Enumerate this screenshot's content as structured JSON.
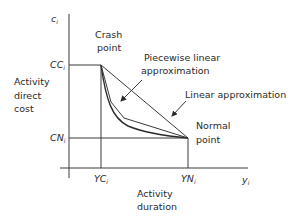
{
  "diagram": {
    "y_axis": {
      "symbol": "c",
      "subscript": "i",
      "label_lines": [
        "Activity",
        "direct",
        "cost"
      ]
    },
    "x_axis": {
      "symbol": "y",
      "subscript": "i",
      "label_lines": [
        "Activity",
        "duration"
      ]
    },
    "y_ticks": [
      {
        "base": "CC",
        "sub": "i"
      },
      {
        "base": "CN",
        "sub": "i"
      }
    ],
    "x_ticks": [
      {
        "base": "YC",
        "sub": "i"
      },
      {
        "base": "YN",
        "sub": "i"
      }
    ],
    "points": {
      "crash": {
        "label_lines": [
          "Crash",
          "point"
        ]
      },
      "normal": {
        "label_lines": [
          "Normal",
          "point"
        ]
      }
    },
    "annotations": {
      "piecewise": {
        "label_lines": [
          "Piecewise linear",
          "approximation"
        ]
      },
      "linear": {
        "label": "Linear approximation"
      }
    }
  }
}
